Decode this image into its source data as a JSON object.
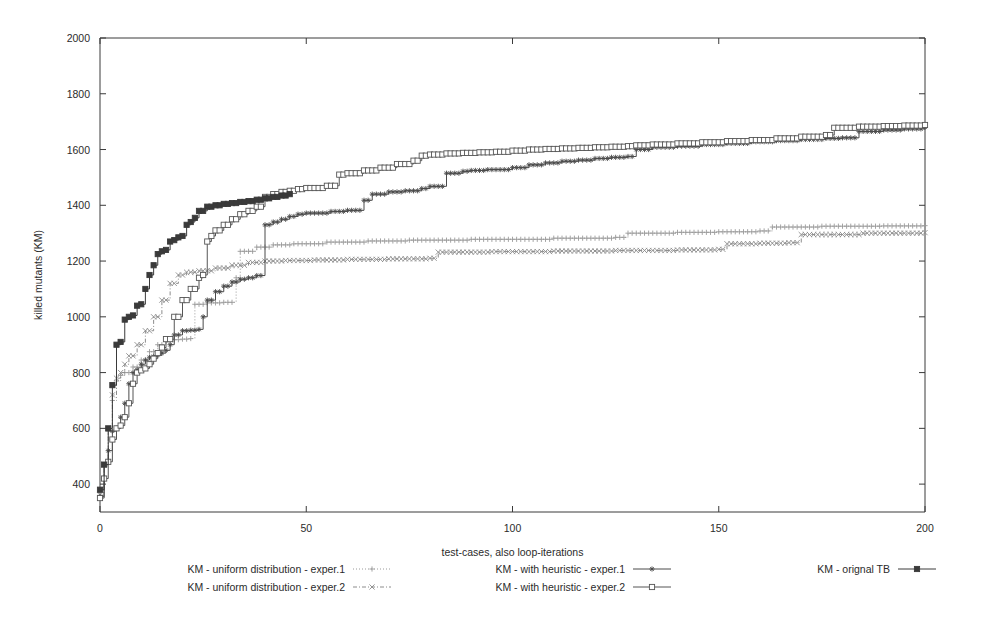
{
  "chart_data": {
    "type": "line",
    "title": "",
    "subtitle": "",
    "xlabel": "test-cases, also loop-iterations",
    "ylabel": "killed mutants (KM)",
    "xlim": [
      0,
      200
    ],
    "ylim": [
      300,
      2000
    ],
    "xticks": [
      0,
      50,
      100,
      150,
      200
    ],
    "xtick_labels": [
      "0",
      "50",
      "100",
      "150",
      "200"
    ],
    "yticks": [
      400,
      600,
      800,
      1000,
      1200,
      1400,
      1600,
      1800,
      2000
    ],
    "ytick_labels": [
      "400",
      "600",
      "800",
      "1000",
      "1200",
      "1400",
      "1600",
      "1800",
      "2000"
    ],
    "grid": false,
    "legend_position": "bottom",
    "step_style": "post",
    "series": [
      {
        "name": "KM - uniform distribution - exper.1",
        "marker": "plus",
        "color": "#9a9a9a",
        "linestyle": "dotted",
        "x": [
          0,
          1,
          2,
          3,
          4,
          5,
          6,
          8,
          10,
          12,
          14,
          16,
          18,
          20,
          22,
          23,
          26,
          30,
          33,
          34,
          38,
          42,
          47,
          55,
          65,
          75,
          90,
          110,
          125,
          128,
          140,
          150,
          160,
          163,
          175,
          190,
          200
        ],
        "y": [
          370,
          465,
          590,
          700,
          770,
          790,
          800,
          820,
          845,
          875,
          900,
          912,
          918,
          920,
          922,
          1045,
          1050,
          1052,
          1140,
          1235,
          1250,
          1258,
          1262,
          1268,
          1272,
          1275,
          1278,
          1282,
          1285,
          1300,
          1303,
          1305,
          1308,
          1322,
          1325,
          1326,
          1327
        ]
      },
      {
        "name": "KM - uniform distribution - exper.2",
        "marker": "cross",
        "color": "#8c8c8c",
        "linestyle": "dashed-dotted",
        "x": [
          0,
          1,
          2,
          3,
          4,
          5,
          6,
          7,
          9,
          11,
          13,
          15,
          17,
          19,
          21,
          24,
          28,
          32,
          36,
          40,
          45,
          52,
          60,
          70,
          80,
          82,
          95,
          110,
          125,
          140,
          150,
          152,
          160,
          167,
          170,
          185,
          200
        ],
        "y": [
          360,
          470,
          600,
          720,
          780,
          800,
          830,
          860,
          900,
          950,
          1000,
          1060,
          1120,
          1150,
          1160,
          1165,
          1175,
          1185,
          1195,
          1200,
          1202,
          1204,
          1206,
          1208,
          1210,
          1232,
          1234,
          1236,
          1238,
          1240,
          1242,
          1262,
          1264,
          1266,
          1295,
          1300,
          1302
        ]
      },
      {
        "name": "KM - with heuristic - exper.1",
        "marker": "star",
        "color": "#4a4a4a",
        "linestyle": "solid",
        "x": [
          0,
          1,
          2,
          3,
          4,
          5,
          6,
          7,
          8,
          9,
          10,
          11,
          12,
          13,
          14,
          15,
          16,
          17,
          18,
          20,
          22,
          24,
          25,
          26,
          28,
          30,
          32,
          34,
          36,
          38,
          40,
          42,
          44,
          46,
          48,
          50,
          56,
          60,
          64,
          66,
          70,
          74,
          78,
          80,
          84,
          88,
          90,
          94,
          100,
          104,
          108,
          112,
          116,
          120,
          124,
          128,
          130,
          134,
          140,
          146,
          152,
          158,
          164,
          170,
          176,
          180,
          184,
          190,
          195,
          200
        ],
        "y": [
          355,
          470,
          520,
          590,
          600,
          640,
          690,
          760,
          800,
          810,
          830,
          845,
          855,
          858,
          862,
          870,
          880,
          900,
          935,
          950,
          952,
          955,
          1000,
          1060,
          1090,
          1110,
          1125,
          1135,
          1140,
          1148,
          1330,
          1340,
          1350,
          1360,
          1368,
          1372,
          1378,
          1382,
          1418,
          1440,
          1448,
          1452,
          1460,
          1468,
          1515,
          1522,
          1525,
          1528,
          1535,
          1545,
          1552,
          1558,
          1562,
          1568,
          1572,
          1575,
          1600,
          1608,
          1612,
          1618,
          1622,
          1628,
          1632,
          1636,
          1640,
          1642,
          1665,
          1670,
          1674,
          1680
        ]
      },
      {
        "name": "KM - with heuristic - exper.2",
        "marker": "square-open",
        "color": "#555555",
        "linestyle": "solid",
        "x": [
          0,
          1,
          2,
          3,
          4,
          5,
          6,
          7,
          8,
          9,
          10,
          11,
          12,
          13,
          14,
          15,
          16,
          18,
          20,
          22,
          24,
          25,
          26,
          27,
          28,
          30,
          32,
          34,
          36,
          38,
          40,
          42,
          44,
          46,
          48,
          50,
          55,
          58,
          60,
          64,
          68,
          72,
          76,
          78,
          80,
          84,
          88,
          92,
          96,
          100,
          104,
          108,
          112,
          116,
          120,
          124,
          128,
          130,
          134,
          140,
          146,
          152,
          158,
          164,
          170,
          176,
          178,
          184,
          190,
          195,
          200
        ],
        "y": [
          350,
          420,
          480,
          560,
          600,
          610,
          640,
          690,
          760,
          800,
          808,
          815,
          830,
          850,
          870,
          890,
          920,
          1000,
          1060,
          1100,
          1140,
          1150,
          1270,
          1290,
          1310,
          1330,
          1350,
          1368,
          1380,
          1395,
          1430,
          1440,
          1448,
          1452,
          1458,
          1462,
          1470,
          1510,
          1515,
          1525,
          1535,
          1548,
          1560,
          1578,
          1582,
          1586,
          1588,
          1590,
          1592,
          1596,
          1600,
          1602,
          1604,
          1606,
          1608,
          1610,
          1612,
          1615,
          1618,
          1622,
          1626,
          1630,
          1634,
          1640,
          1646,
          1652,
          1678,
          1682,
          1684,
          1686,
          1688
        ]
      },
      {
        "name": "KM - orignal TB",
        "marker": "square-filled",
        "color": "#3a3a3a",
        "linestyle": "solid",
        "x": [
          0,
          1,
          2,
          3,
          4,
          5,
          6,
          7,
          8,
          9,
          10,
          11,
          12,
          13,
          14,
          15,
          16,
          17,
          18,
          19,
          20,
          21,
          22,
          23,
          24,
          26,
          28,
          30,
          32,
          34,
          36,
          38,
          40,
          42,
          44,
          46
        ],
        "y": [
          380,
          470,
          600,
          755,
          900,
          910,
          990,
          1000,
          1005,
          1040,
          1045,
          1100,
          1150,
          1185,
          1225,
          1235,
          1240,
          1270,
          1275,
          1285,
          1290,
          1330,
          1340,
          1355,
          1380,
          1395,
          1400,
          1405,
          1408,
          1412,
          1415,
          1420,
          1425,
          1430,
          1435,
          1440
        ]
      }
    ]
  },
  "legend": {
    "entries": [
      {
        "label": "KM - uniform distribution - exper.1",
        "marker": "plus",
        "color": "#9a9a9a",
        "column": 0,
        "row": 0
      },
      {
        "label": "KM - uniform distribution - exper.2",
        "marker": "cross",
        "color": "#8c8c8c",
        "column": 0,
        "row": 1
      },
      {
        "label": "KM - with heuristic - exper.1",
        "marker": "star",
        "color": "#4a4a4a",
        "column": 1,
        "row": 0
      },
      {
        "label": "KM - with heuristic - exper.2",
        "marker": "square-open",
        "color": "#555555",
        "column": 1,
        "row": 1
      },
      {
        "label": "KM - orignal TB",
        "marker": "square-filled",
        "color": "#3a3a3a",
        "column": 2,
        "row": 0
      }
    ]
  },
  "colors": {
    "background": "#ffffff",
    "frame": "#3a3a3a",
    "text": "#2b2b2b"
  }
}
